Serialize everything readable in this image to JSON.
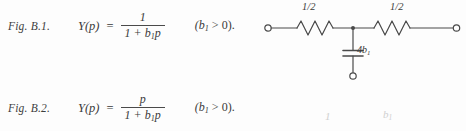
{
  "document": {
    "type": "textbook-figure-excerpt",
    "background_color": "#fdfdfd",
    "ink_color": "#3a3a3a"
  },
  "formulas": [
    {
      "figure_label": "Fig. B.1.",
      "lhs": "Y(p)",
      "equals": "=",
      "numerator": "1",
      "denominator_a": "1 + b",
      "denominator_sub": "1",
      "denominator_b": "p",
      "condition_open": "(b",
      "condition_sub": "1",
      "condition_op": " > ",
      "condition_close": "0)."
    },
    {
      "figure_label": "Fig. B.2.",
      "lhs": "Y(p)",
      "equals": "=",
      "numerator": "p",
      "denominator_a": "1 + b",
      "denominator_sub": "1",
      "denominator_b": "p",
      "condition_open": "(b",
      "condition_sub": "1",
      "condition_op": " > ",
      "condition_close": "0)."
    }
  ],
  "circuit": {
    "description": "T-network: two series resistors and one shunt capacitor",
    "resistor_left_label": "1/2",
    "resistor_right_label": "1/2",
    "capacitor_value": "4b",
    "capacitor_sub": "1",
    "terminal_count": 3,
    "line_color": "#4a4a4a"
  },
  "artifacts": {
    "bleed_one": "1",
    "bleed_two_base": "b",
    "bleed_two_sub": "1"
  }
}
